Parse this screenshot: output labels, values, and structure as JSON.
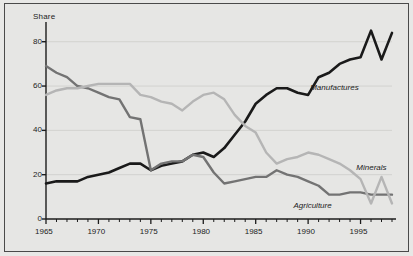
{
  "chart_data": {
    "type": "line",
    "title": "",
    "subtitle": "",
    "xlabel": "",
    "ylabel": "Share",
    "xlim": [
      1965,
      1998
    ],
    "ylim": [
      0,
      88
    ],
    "grid": true,
    "grid_axis": "y",
    "legend_position": "inline-right",
    "yticks": [
      0,
      20,
      40,
      60,
      80
    ],
    "ytick_labels": [
      "0",
      "20",
      "40",
      "60",
      "80"
    ],
    "xticks": [
      1965,
      1970,
      1975,
      1980,
      1985,
      1990,
      1995
    ],
    "xtick_labels": [
      "1965",
      "1970",
      "1975",
      "1980",
      "1985",
      "1990",
      "1995"
    ],
    "x_minor_tick_interval": 1,
    "x": [
      1965,
      1966,
      1967,
      1968,
      1969,
      1970,
      1971,
      1972,
      1973,
      1974,
      1975,
      1976,
      1977,
      1978,
      1979,
      1980,
      1981,
      1982,
      1983,
      1984,
      1985,
      1986,
      1987,
      1988,
      1989,
      1990,
      1991,
      1992,
      1993,
      1994,
      1995,
      1996,
      1997,
      1998
    ],
    "series": [
      {
        "name": "Manufactures",
        "color": "#1a1a1a",
        "width": 2.6,
        "label_x": 1990.2,
        "label_y": 59,
        "values": [
          16,
          17,
          17,
          17,
          19,
          20,
          21,
          23,
          25,
          25,
          22,
          24,
          25,
          26,
          29,
          30,
          28,
          32,
          38,
          44,
          52,
          56,
          59,
          59,
          57,
          56,
          64,
          66,
          70,
          72,
          73,
          85,
          72,
          84
        ]
      },
      {
        "name": "Agriculture",
        "color": "#737373",
        "width": 2.4,
        "label_x": 1988.6,
        "label_y": 6,
        "values": [
          69,
          66,
          64,
          60,
          59,
          57,
          55,
          54,
          46,
          45,
          22,
          25,
          26,
          26,
          29,
          28,
          21,
          16,
          17,
          18,
          19,
          19,
          22,
          20,
          19,
          17,
          15,
          11,
          11,
          12,
          12,
          11,
          11,
          11
        ]
      },
      {
        "name": "Minerals",
        "color": "#b5b5b5",
        "width": 2.4,
        "label_x": 1994.6,
        "label_y": 23,
        "values": [
          56,
          58,
          59,
          59,
          60,
          61,
          61,
          61,
          61,
          56,
          55,
          53,
          52,
          49,
          53,
          56,
          57,
          54,
          47,
          42,
          39,
          30,
          25,
          27,
          28,
          30,
          29,
          27,
          25,
          22,
          18,
          7,
          19,
          7
        ]
      }
    ]
  },
  "axis": {
    "y_title": "Share"
  }
}
